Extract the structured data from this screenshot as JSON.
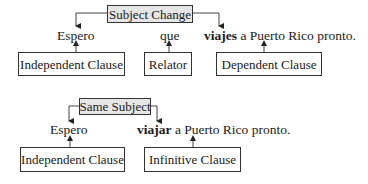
{
  "diagram_1": {
    "label": "Subject Change",
    "sentence": {
      "word1": "Espero",
      "word2": "que",
      "verb": "viajes",
      "rest": " a Puerto Rico pronto."
    },
    "boxes": [
      "Independent Clause",
      "Relator",
      "Dependent Clause"
    ]
  },
  "diagram_2": {
    "label": "Same Subject",
    "sentence": {
      "word1": "Espero",
      "verb": "viajar",
      "rest": " a Puerto Rico pronto."
    },
    "boxes": [
      "Independent Clause",
      "Infinitive Clause"
    ]
  }
}
